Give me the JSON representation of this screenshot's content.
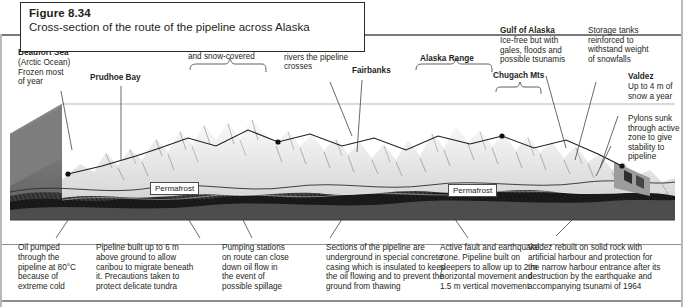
{
  "figure": {
    "number": "Figure 8.34",
    "caption": "Cross-section of the route of the pipeline across Alaska"
  },
  "top_labels": [
    {
      "id": "beaufort-sea",
      "title": "Beaufort Sea",
      "body": "(Arctic Ocean)\nFrozen most\nof year"
    },
    {
      "id": "prudhoe-bay",
      "title": "Prudhoe Bay",
      "body": ""
    },
    {
      "id": "brooks-range",
      "title": "Brooks Range",
      "body": "Up to 1460 m high\nand snow-covered"
    },
    {
      "id": "yukon-river",
      "title": "Yukon River",
      "body": "One of the 350\nrivers the pipeline\ncrosses"
    },
    {
      "id": "fairbanks",
      "title": "Fairbanks",
      "body": ""
    },
    {
      "id": "alaska-range",
      "title": "Alaska Range",
      "body": ""
    },
    {
      "id": "chugach-mts",
      "title": "Chugach Mts",
      "body": ""
    },
    {
      "id": "gulf-of-alaska",
      "title": "Gulf of Alaska",
      "body": "Ice-free but with\ngales, floods and\npossible tsunamis"
    },
    {
      "id": "storage-tanks",
      "title": "",
      "body": "Storage tanks\nreinforced to\nwithstand weight\nof snowfalls"
    },
    {
      "id": "valdez",
      "title": "Valdez",
      "body": "Up to 4 m of\nsnow a year"
    },
    {
      "id": "pylons",
      "title": "",
      "body": "Pylons sunk\nthrough active\nzone to give\nstability to\npipeline"
    }
  ],
  "map_tags": [
    {
      "id": "permafrost-left",
      "label": "Permafrost"
    },
    {
      "id": "permafrost-right",
      "label": "Permafrost"
    }
  ],
  "bottom_notes": [
    {
      "id": "oil-temperature",
      "text": "Oil pumped\nthrough the\npipeline at 80°C\nbecause of\nextreme cold"
    },
    {
      "id": "elevated-pipeline",
      "text": "Pipeline built up to 6 m\nabove ground to allow\ncaribou to migrate beneath\nit. Precautions taken to\nprotect delicate tundra"
    },
    {
      "id": "pumping-stations",
      "text": "Pumping stations\non route can close\ndown oil flow in\nthe event of\npossible spillage"
    },
    {
      "id": "underground-sections",
      "text": "Sections of the pipeline are\nunderground in special concrete\ncasing which is insulated to keep\nthe oil flowing and to prevent the\nground from thawing"
    },
    {
      "id": "active-fault",
      "text": "Active fault and earthquake\nzone. Pipeline built on\nsleepers to allow up to 2 m\nhorizontal movement and\n1.5 m vertical movement"
    },
    {
      "id": "valdez-rebuilt",
      "text": "Valdez rebuilt on solid rock with\nartificial harbour and protection for\nthe narrow harbour entrance after its\ndestruction by the earthquake and\naccompanying tsunami of 1964"
    }
  ],
  "colors": {
    "text": "#231f20",
    "frame": "#8d8d8d",
    "leader": "#555555",
    "sky": "#ffffff",
    "rock_dark": "#1a1a1a",
    "rock_mid": "#6e6e6e",
    "rock_light": "#c9c9c9",
    "snow": "#f2f2f2"
  }
}
